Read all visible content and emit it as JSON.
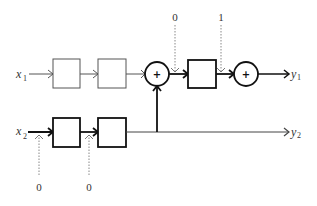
{
  "diagram": {
    "inputs": [
      {
        "name": "x",
        "sub": "1"
      },
      {
        "name": "x",
        "sub": "2"
      }
    ],
    "outputs": [
      {
        "name": "y",
        "sub": "1"
      },
      {
        "name": "y",
        "sub": "2"
      }
    ],
    "adders": [
      {
        "symbol": "+"
      },
      {
        "symbol": "+"
      }
    ],
    "control_inputs": {
      "top_0": "0",
      "top_1": "1",
      "bottom_0a": "0",
      "bottom_0b": "0"
    },
    "colors": {
      "stroke_thin": "#555555",
      "stroke_bold": "#111111",
      "dashed": "#888888"
    }
  }
}
